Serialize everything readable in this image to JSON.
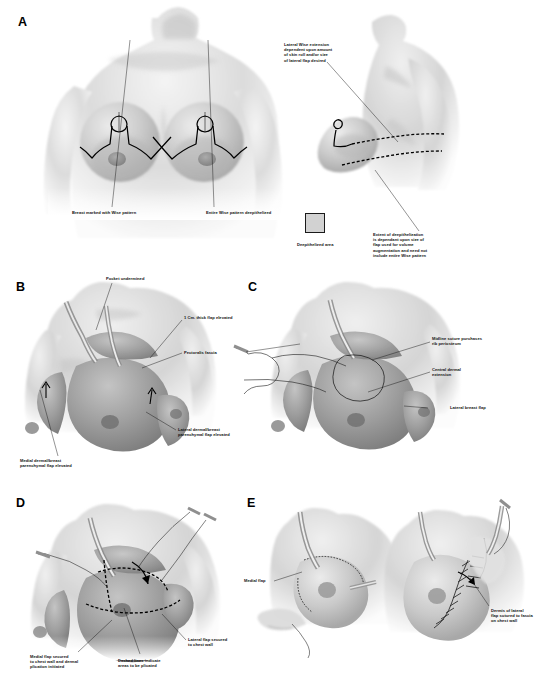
{
  "figure": {
    "background_color": "#ffffff",
    "ink_color": "#000000",
    "deepithelized_swatch_color": "#d2d2d2"
  },
  "panels": [
    {
      "letter": "A",
      "views": [
        "anterior frontal view",
        "lateral oblique view"
      ],
      "callouts": [
        {
          "id": "a-lateral-wise",
          "text": "Lateral Wise extension\ndependent upon amount\nof skin roll and/or size\nof lateral flap desired"
        },
        {
          "id": "a-breast-marked",
          "text": "Breast marked with Wise pattern"
        },
        {
          "id": "a-entire-wise",
          "text": "Entire Wise pattern deepithelized"
        },
        {
          "id": "a-legend",
          "text": "Deepithelized area"
        },
        {
          "id": "a-extent",
          "text": "Extent of deepithelization\nis dependant upon size of\nflap used for volume\naugmentation and need not\ninclude entire Wise pattern"
        }
      ]
    },
    {
      "letter": "B",
      "views": [
        "oblique view with retractors"
      ],
      "callouts": [
        {
          "id": "b-pocket",
          "text": "Pocket undermined"
        },
        {
          "id": "b-thickness",
          "text": "1 Cm. thick flap elevated"
        },
        {
          "id": "b-pectoralis",
          "text": "Pectoralis fascia"
        },
        {
          "id": "b-lateral-flap",
          "text": "Lateral dermal/breast\nparenchymal flap elevated"
        },
        {
          "id": "b-medial-flap",
          "text": "Medial dermal/breast\nparenchymal flap elevated"
        }
      ]
    },
    {
      "letter": "C",
      "views": [
        "oblique view with midline suture"
      ],
      "callouts": [
        {
          "id": "c-midline-suture",
          "text": "Midline suture purchases\nrib periosteum"
        },
        {
          "id": "c-central-dermal",
          "text": "Central dermal\nextension"
        },
        {
          "id": "c-lateral-breast-flap",
          "text": "Lateral breast flap"
        }
      ]
    },
    {
      "letter": "D",
      "views": [
        "oblique view with plication sutures"
      ],
      "callouts": [
        {
          "id": "d-medial-secured",
          "text": "Medial flap secured\nto chest wall and dermal\nplication initiated"
        },
        {
          "id": "d-dashed",
          "text": "Dashed lines indicate\nareas to be plicated"
        },
        {
          "id": "d-lateral-secured",
          "text": "Lateral flap secured\nto chest wall"
        }
      ]
    },
    {
      "letter": "E",
      "views": [
        "left sub-view with retractor",
        "right sub-view with closure sutures"
      ],
      "callouts": [
        {
          "id": "e-medial-flap",
          "text": "Medial flap"
        },
        {
          "id": "e-dermis-lateral",
          "text": "Dermis of lateral\nflap sutured to fascia\non chest wall"
        }
      ]
    }
  ]
}
